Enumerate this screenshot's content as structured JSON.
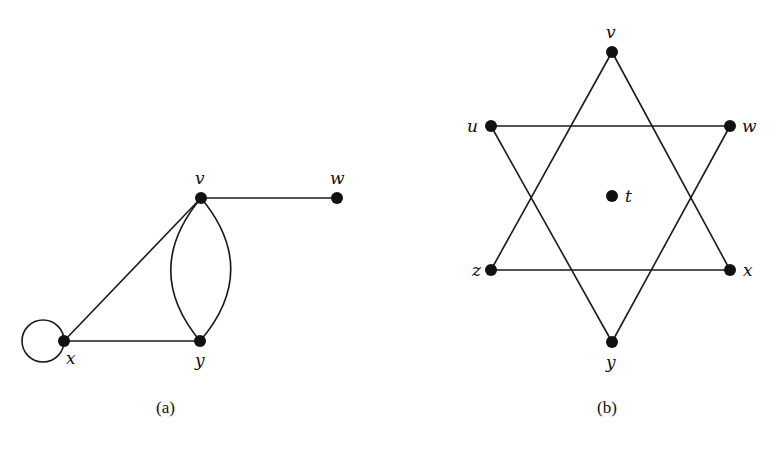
{
  "figure": {
    "graph_a": {
      "caption": "(a)",
      "vertices": [
        {
          "id": "v",
          "label": "v",
          "x": 201,
          "y": 198
        },
        {
          "id": "w",
          "label": "w",
          "x": 337,
          "y": 198
        },
        {
          "id": "x",
          "label": "x",
          "x": 64,
          "y": 341
        },
        {
          "id": "y",
          "label": "y",
          "x": 200,
          "y": 341
        }
      ],
      "edges": [
        {
          "from": "v",
          "to": "w",
          "type": "straight"
        },
        {
          "from": "v",
          "to": "x",
          "type": "straight"
        },
        {
          "from": "x",
          "to": "y",
          "type": "straight"
        },
        {
          "from": "v",
          "to": "y",
          "type": "curved-left"
        },
        {
          "from": "v",
          "to": "y",
          "type": "curved-right"
        },
        {
          "from": "x",
          "to": "x",
          "type": "loop"
        }
      ]
    },
    "graph_b": {
      "caption": "(b)",
      "vertices": [
        {
          "id": "v",
          "label": "v",
          "x": 612,
          "y": 52
        },
        {
          "id": "u",
          "label": "u",
          "x": 491,
          "y": 126
        },
        {
          "id": "w",
          "label": "w",
          "x": 730,
          "y": 126
        },
        {
          "id": "t",
          "label": "t",
          "x": 612,
          "y": 196
        },
        {
          "id": "z",
          "label": "z",
          "x": 491,
          "y": 270
        },
        {
          "id": "x",
          "label": "x",
          "x": 730,
          "y": 270
        },
        {
          "id": "y",
          "label": "y",
          "x": 612,
          "y": 342
        }
      ],
      "edges": [
        {
          "from": "v",
          "to": "z"
        },
        {
          "from": "v",
          "to": "x"
        },
        {
          "from": "z",
          "to": "x"
        },
        {
          "from": "u",
          "to": "w"
        },
        {
          "from": "u",
          "to": "y"
        },
        {
          "from": "w",
          "to": "y"
        }
      ],
      "isolated_vertices": [
        "t"
      ]
    }
  }
}
